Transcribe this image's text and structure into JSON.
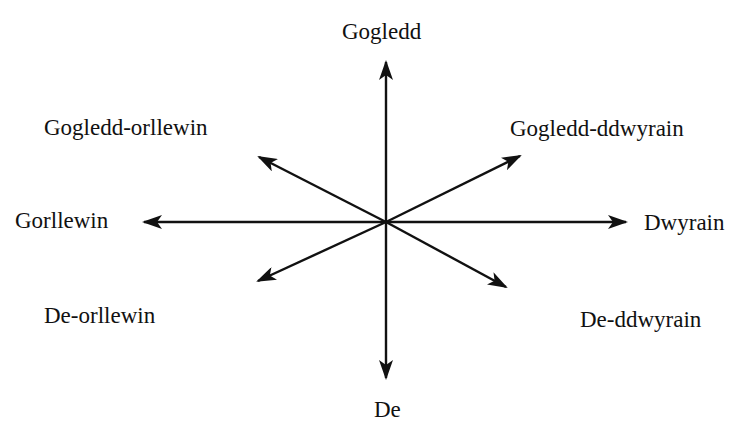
{
  "diagram": {
    "type": "compass-rose",
    "center": {
      "x": 386,
      "y": 222
    },
    "directions": {
      "n": {
        "label": "Gogledd"
      },
      "ne": {
        "label": "Gogledd-ddwyrain"
      },
      "e": {
        "label": "Dwyrain"
      },
      "se": {
        "label": "De-ddwyrain"
      },
      "s": {
        "label": "De"
      },
      "sw": {
        "label": "De-orllewin"
      },
      "w": {
        "label": "Gorllewin"
      },
      "nw": {
        "label": "Gogledd-orllewin"
      }
    },
    "colors": {
      "arrow": "#111111",
      "text": "#111111",
      "background": "#ffffff"
    }
  }
}
